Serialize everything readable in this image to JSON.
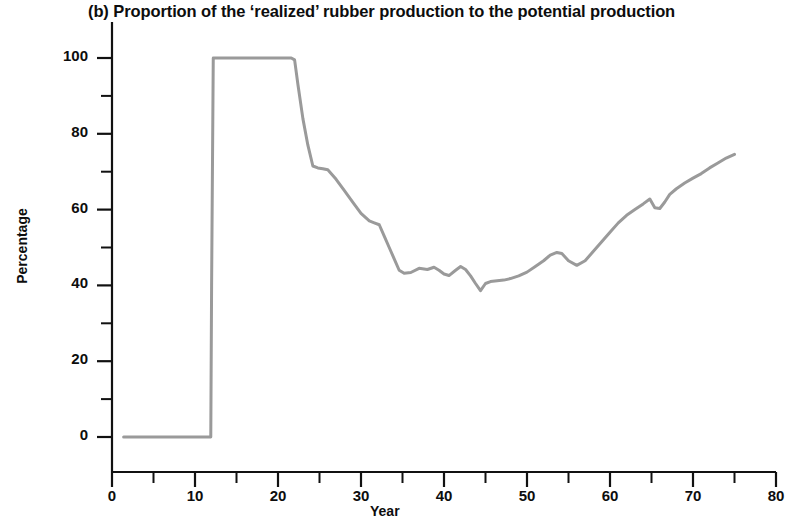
{
  "chart_data": {
    "type": "line",
    "title": "(b) Proportion of the ‘realized’ rubber production to the potential production",
    "xlabel": "Year",
    "ylabel": "Percentage",
    "xlim": [
      0,
      80
    ],
    "ylim": [
      0,
      100
    ],
    "grid": false,
    "legend": null,
    "line_color": "#9a9a9a",
    "x_ticks": [
      0,
      10,
      20,
      30,
      40,
      50,
      60,
      70,
      80
    ],
    "x_tick_labels": [
      "0",
      "10",
      "20",
      "30",
      "40",
      "50",
      "60",
      "70",
      "80"
    ],
    "x_minor_ticks": [
      5,
      15,
      25,
      35,
      45,
      55,
      65,
      75
    ],
    "y_ticks": [
      0,
      20,
      40,
      60,
      80,
      100
    ],
    "y_tick_labels": [
      "0",
      "20",
      "40",
      "60",
      "80",
      "100"
    ],
    "y_minor_ticks": [
      10,
      30,
      50,
      70,
      90
    ],
    "series": [
      {
        "name": "realized / potential rubber production",
        "x": [
          1.4,
          3.0,
          5.0,
          7.0,
          9.0,
          11.0,
          11.9,
          12.0,
          12.2,
          13.0,
          14.0,
          15.0,
          16.0,
          17.0,
          18.0,
          19.0,
          20.0,
          21.0,
          21.6,
          22.0,
          22.4,
          23.0,
          23.6,
          24.2,
          24.8,
          25.4,
          26.0,
          27.0,
          28.0,
          29.0,
          30.0,
          31.0,
          31.6,
          32.2,
          32.8,
          33.4,
          34.0,
          34.6,
          35.2,
          36.0,
          37.0,
          38.0,
          38.8,
          39.4,
          40.0,
          40.6,
          41.4,
          42.0,
          42.6,
          43.2,
          43.8,
          44.4,
          45.0,
          45.6,
          46.4,
          47.2,
          48.0,
          49.0,
          50.0,
          51.0,
          52.0,
          52.8,
          53.6,
          54.2,
          55.0,
          56.0,
          57.0,
          58.0,
          59.0,
          60.0,
          61.0,
          62.0,
          63.0,
          64.0,
          64.8,
          65.4,
          66.0,
          66.6,
          67.2,
          68.0,
          69.0,
          70.0,
          71.0,
          72.0,
          73.0,
          74.0,
          75.0
        ],
        "y": [
          0.0,
          0.0,
          0.0,
          0.0,
          0.0,
          0.0,
          0.0,
          40.0,
          100.0,
          100.0,
          100.0,
          100.0,
          100.0,
          100.0,
          100.0,
          100.0,
          100.0,
          100.0,
          100.0,
          99.5,
          93.0,
          84.0,
          77.0,
          71.5,
          71.0,
          70.8,
          70.5,
          68.0,
          65.0,
          62.0,
          59.0,
          57.0,
          56.5,
          56.0,
          53.0,
          50.0,
          47.0,
          44.0,
          43.2,
          43.4,
          44.5,
          44.2,
          44.8,
          44.0,
          43.0,
          42.6,
          44.0,
          45.0,
          44.2,
          42.5,
          40.5,
          38.6,
          40.5,
          41.0,
          41.2,
          41.4,
          41.8,
          42.5,
          43.5,
          45.0,
          46.5,
          48.0,
          48.7,
          48.4,
          46.5,
          45.3,
          46.5,
          49.0,
          51.5,
          54.0,
          56.5,
          58.5,
          60.0,
          61.5,
          62.8,
          60.5,
          60.3,
          62.0,
          64.0,
          65.5,
          67.0,
          68.3,
          69.5,
          71.0,
          72.3,
          73.6,
          74.6
        ]
      }
    ]
  }
}
